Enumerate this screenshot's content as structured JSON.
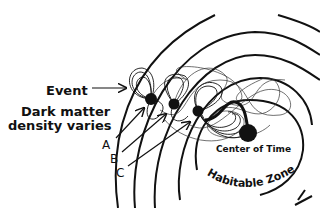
{
  "diagram": {
    "labels": {
      "event": "Event",
      "dark_matter_line1": "Dark matter",
      "dark_matter_line2": "density varies",
      "point_a": "A",
      "point_b": "B",
      "point_c": "C",
      "center_of_time": "Center of Time",
      "habitable_zone": "Habitable Zone 1"
    },
    "colors": {
      "stroke": "#111111",
      "background": "#ffffff"
    }
  }
}
